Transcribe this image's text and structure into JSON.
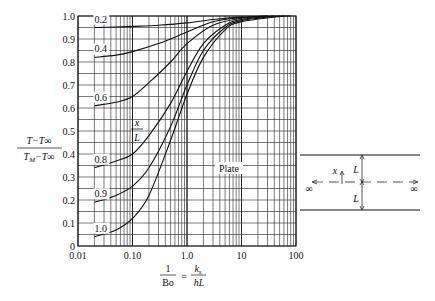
{
  "chart_data": {
    "type": "line",
    "title": "",
    "xscale": "log",
    "xlabel": "1/Bo = k_s / (h L)",
    "xlabel_parts": {
      "lhs_num": "1",
      "lhs_den": "Bo",
      "eq": "=",
      "rhs_num": "k",
      "rhs_num_sub": "s",
      "rhs_den": "hL"
    },
    "ylabel": "(T − T∞)/(T_M − T∞)",
    "ylabel_parts": {
      "num": "T−T∞",
      "den": "T_M−T∞"
    },
    "xlim": [
      0.01,
      100
    ],
    "ylim": [
      0,
      1.0
    ],
    "x_ticks": [
      "0.01",
      "0.10",
      "1.0",
      "10",
      "100"
    ],
    "y_ticks": [
      "0",
      "0.1",
      "0.2",
      "0.3",
      "0.4",
      "0.5",
      "0.6",
      "0.7",
      "0.8",
      "0.9",
      "1.0"
    ],
    "grid": true,
    "legend_title": "x/L",
    "annotation": "Plate",
    "series": [
      {
        "name": "0.2",
        "x": [
          0.02,
          0.05,
          0.1,
          0.3,
          1,
          3,
          10,
          30,
          80
        ],
        "y": [
          0.95,
          0.952,
          0.955,
          0.96,
          0.97,
          0.985,
          0.995,
          0.999,
          1.0
        ]
      },
      {
        "name": "0.4",
        "x": [
          0.02,
          0.05,
          0.1,
          0.3,
          1,
          3,
          10,
          30
        ],
        "y": [
          0.82,
          0.83,
          0.845,
          0.88,
          0.93,
          0.975,
          0.993,
          1.0
        ]
      },
      {
        "name": "0.6",
        "x": [
          0.02,
          0.05,
          0.1,
          0.2,
          0.5,
          1,
          3,
          10,
          30
        ],
        "y": [
          0.61,
          0.625,
          0.65,
          0.71,
          0.8,
          0.88,
          0.96,
          0.99,
          1.0
        ]
      },
      {
        "name": "0.8",
        "x": [
          0.02,
          0.05,
          0.1,
          0.2,
          0.5,
          1,
          2,
          5,
          10,
          40
        ],
        "y": [
          0.34,
          0.37,
          0.4,
          0.48,
          0.62,
          0.76,
          0.88,
          0.96,
          0.985,
          1.0
        ]
      },
      {
        "name": "0.9",
        "x": [
          0.02,
          0.05,
          0.1,
          0.2,
          0.5,
          1,
          2,
          5,
          10,
          50
        ],
        "y": [
          0.19,
          0.22,
          0.26,
          0.34,
          0.52,
          0.7,
          0.85,
          0.95,
          0.98,
          1.0
        ]
      },
      {
        "name": "1.0",
        "x": [
          0.02,
          0.05,
          0.1,
          0.2,
          0.5,
          1,
          2,
          5,
          10,
          60
        ],
        "y": [
          0.04,
          0.07,
          0.12,
          0.22,
          0.46,
          0.66,
          0.82,
          0.94,
          0.975,
          1.0
        ]
      }
    ]
  },
  "diagram": {
    "x_label": "x",
    "half_thickness_label": "L",
    "left_infinity": "∞",
    "right_infinity": "∞"
  }
}
